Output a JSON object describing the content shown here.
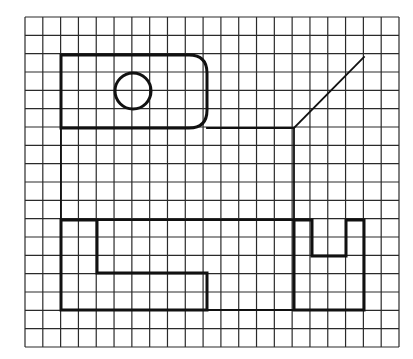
{
  "diagram": {
    "type": "orthographic-projection-exercise",
    "background": "#ffffff",
    "line_color": "#111111",
    "grid": {
      "x0": 25,
      "y0": 17,
      "x1": 399,
      "y1": 347,
      "columns": 21,
      "rows": 18
    },
    "shapes": {
      "top_view_rect": {
        "x": 61,
        "y": 55,
        "w": 146,
        "h": 73,
        "corner_radius": 18
      },
      "top_view_circle": {
        "cx": 133,
        "cy": 91,
        "r": 18
      },
      "construction_lines": [
        {
          "x1": 207,
          "y1": 128,
          "x2": 294,
          "y2": 128
        },
        {
          "x1": 294,
          "y1": 128,
          "x2": 364,
          "y2": 57
        },
        {
          "x1": 294,
          "y1": 128,
          "x2": 294,
          "y2": 220
        },
        {
          "x1": 61,
          "y1": 128,
          "x2": 61,
          "y2": 220
        },
        {
          "x1": 97,
          "y1": 220,
          "x2": 294,
          "y2": 220
        },
        {
          "x1": 207,
          "y1": 310,
          "x2": 294,
          "y2": 310
        }
      ],
      "front_view_l_shape": "61,220 97,220 97,273 207,273 207,310 61,310",
      "side_view_u_shape": "294,220 312,220 312,256 346,256 346,220 364,220 364,310 294,310"
    }
  }
}
